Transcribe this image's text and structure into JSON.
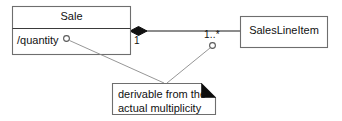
{
  "diagram": {
    "type": "uml-class-diagram",
    "notation": "UML",
    "colors": {
      "background": "#ffffff",
      "box_stroke": "#6e6e6e",
      "line_stroke": "#1a1a1a",
      "anchor_stroke": "#8a8a8a",
      "text": "#111111",
      "diamond_fill": "#111111",
      "note_fold_fill": "#0d0d0d"
    },
    "classes": [
      {
        "id": "sale",
        "name": "Sale",
        "compartments": {
          "attributes": [
            {
              "text": "/quantity",
              "derived": true,
              "has_anchor_marker": true
            }
          ],
          "operations": []
        }
      },
      {
        "id": "saleslineitem",
        "name": "SalesLineItem",
        "compartments": {
          "attributes": [],
          "operations": []
        }
      }
    ],
    "association": {
      "id": "sale-contains-lineitems",
      "kind": "composition",
      "source": "sale",
      "target": "saleslineitem",
      "source_adornment": "filled-diamond",
      "source_multiplicity": "1",
      "target_multiplicity": "1..*",
      "target_has_anchor_marker": true
    },
    "note": {
      "id": "derivation-note",
      "shape": "note-with-folded-corner",
      "lines": [
        "derivable from the",
        "actual multiplicity"
      ],
      "anchors": [
        "sale./quantity",
        "association.target_multiplicity"
      ]
    }
  }
}
